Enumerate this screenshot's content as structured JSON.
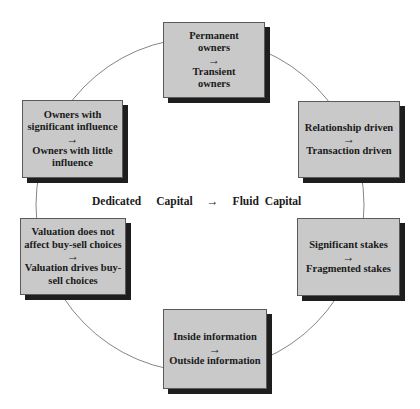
{
  "diagram": {
    "center": {
      "from_word1": "Dedicated",
      "from_word2": "Capital",
      "arrow": "→",
      "to_word1": "Fluid",
      "to_word2": "Capital"
    },
    "boxes": [
      {
        "id": "top",
        "from_lines": [
          "Permanent",
          "owners"
        ],
        "arrow": "→",
        "to_lines": [
          "Transient",
          "owners"
        ]
      },
      {
        "id": "upper-right",
        "from_lines": [
          "Relationship driven"
        ],
        "arrow": "→",
        "to_lines": [
          "Transaction driven"
        ]
      },
      {
        "id": "lower-right",
        "from_lines": [
          "Significant stakes"
        ],
        "arrow": "→",
        "to_lines": [
          "Fragmented stakes"
        ]
      },
      {
        "id": "bottom",
        "from_lines": [
          "Inside information"
        ],
        "arrow": "→",
        "to_lines": [
          "Outside information"
        ]
      },
      {
        "id": "lower-left",
        "from_lines": [
          "Valuation does not",
          "affect buy-sell choices"
        ],
        "arrow": "→",
        "to_lines": [
          "Valuation drives buy-",
          "sell choices"
        ]
      },
      {
        "id": "upper-left",
        "from_lines": [
          "Owners with",
          "significant influence"
        ],
        "arrow": "→",
        "to_lines": [
          "Owners with little",
          "influence"
        ]
      }
    ],
    "colors": {
      "box_fill": "#c9c9c9",
      "box_shadow": "#1e1e1e",
      "ring_stroke": "#777777",
      "text": "#1a1a1a"
    }
  }
}
